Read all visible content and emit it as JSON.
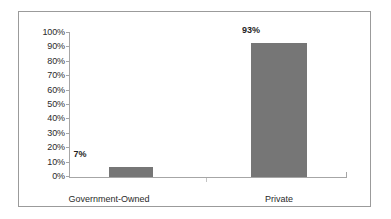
{
  "chart_data": {
    "type": "bar",
    "title": "",
    "subtitle": "",
    "xlabel": "",
    "ylabel": "",
    "categories": [
      "Government-Owned",
      "Private"
    ],
    "values": [
      7,
      93
    ],
    "data_labels": [
      "7%",
      "93%"
    ],
    "ylim": [
      0,
      100
    ],
    "y_ticks": [
      0,
      10,
      20,
      30,
      40,
      50,
      60,
      70,
      80,
      90,
      100
    ],
    "y_tick_labels": [
      "0%",
      "10%",
      "20%",
      "30%",
      "40%",
      "50%",
      "60%",
      "70%",
      "80%",
      "90%",
      "100%"
    ],
    "grid": false,
    "legend": false,
    "legend_position": "none",
    "series": [
      {
        "name": "",
        "values": [
          7,
          93
        ],
        "color": "#767676"
      }
    ],
    "colors": {
      "bar_fill": "#767676",
      "axis_line": "#a6a6a6",
      "frame_border": "#9b9b9b",
      "plot_background": "#ffffff",
      "label_text": "#2a2a2a",
      "data_label_text": "#1f1f1f"
    }
  }
}
